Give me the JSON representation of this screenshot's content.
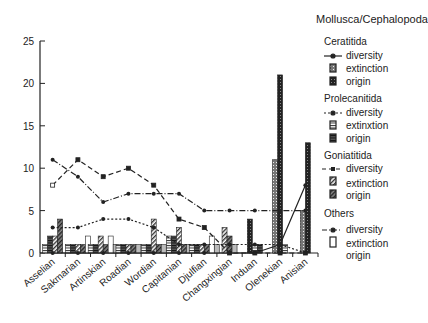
{
  "chart_data": {
    "type": "bar",
    "title": "Mollusca/Cephalopoda",
    "xlabel": "",
    "ylabel": "",
    "ylim": [
      0,
      25
    ],
    "yticks": [
      0,
      5,
      10,
      15,
      20,
      25
    ],
    "grid": false,
    "legend_position": "right",
    "categories": [
      "Asselian",
      "Sakmarian",
      "Artinskian",
      "Roadian",
      "Wordian",
      "Capitanian",
      "Djulfian",
      "Changxingian",
      "Induan",
      "Olenekian",
      "Anisian"
    ],
    "series": [
      {
        "group": "Ceratitida",
        "name": "diversity",
        "kind": "line",
        "style": "solid",
        "values": [
          0,
          0,
          0,
          0,
          0,
          0,
          0,
          0,
          0,
          1,
          8
        ]
      },
      {
        "group": "Ceratitida",
        "name": "extinction",
        "kind": "bar",
        "values": [
          0,
          0,
          0,
          0,
          0,
          0,
          0,
          0,
          0,
          11,
          5
        ]
      },
      {
        "group": "Ceratitida",
        "name": "origin",
        "kind": "bar",
        "values": [
          0,
          0,
          0,
          0,
          0,
          0,
          0,
          0,
          4,
          21,
          13
        ]
      },
      {
        "group": "Prolecanitida",
        "name": "diversity",
        "kind": "line",
        "style": "dashed",
        "values": [
          3,
          3,
          4,
          4,
          3,
          1,
          1,
          1,
          1,
          1,
          0
        ]
      },
      {
        "group": "Prolecanitida",
        "name": "extinction",
        "kind": "bar",
        "values": [
          1,
          1,
          1,
          1,
          1,
          2,
          1,
          0,
          1,
          1,
          0
        ]
      },
      {
        "group": "Prolecanitida",
        "name": "origin",
        "kind": "bar",
        "values": [
          2,
          1,
          1,
          1,
          1,
          2,
          1,
          0,
          1,
          0,
          0
        ]
      },
      {
        "group": "Goniatitida",
        "name": "diversity",
        "kind": "line",
        "style": "longdash",
        "values": [
          8,
          11,
          9,
          10,
          8,
          4,
          3,
          0,
          0,
          0,
          0
        ]
      },
      {
        "group": "Goniatitida",
        "name": "extinction",
        "kind": "bar",
        "values": [
          2,
          1,
          2,
          1,
          4,
          3,
          1,
          3,
          0,
          0,
          0
        ]
      },
      {
        "group": "Goniatitida",
        "name": "origin",
        "kind": "bar",
        "values": [
          4,
          1,
          1,
          1,
          1,
          1,
          1,
          2,
          0,
          0,
          0
        ]
      },
      {
        "group": "Others",
        "name": "diversity",
        "kind": "line",
        "style": "dashdot",
        "values": [
          11,
          9,
          6,
          7,
          7,
          7,
          5,
          5,
          5,
          5,
          5
        ]
      },
      {
        "group": "Others",
        "name": "extinction",
        "kind": "bar",
        "values": [
          0,
          2,
          2,
          0,
          0,
          0,
          2,
          0,
          0,
          0,
          0
        ]
      },
      {
        "group": "Others",
        "name": "origin",
        "kind": "bar",
        "values": [
          0,
          0,
          1,
          1,
          1,
          1,
          1,
          1,
          0,
          0,
          0
        ]
      }
    ]
  },
  "legend": {
    "title": "Mollusca/Cephalopoda",
    "groups": [
      {
        "name": "Ceratitida",
        "items": [
          "diversity",
          "extinction",
          "origin"
        ]
      },
      {
        "name": "Prolecanitida",
        "items": [
          "diversity",
          "extinxtion",
          "origin"
        ]
      },
      {
        "name": "Goniatitida",
        "items": [
          "diversity",
          "extinction",
          "origin"
        ]
      },
      {
        "name": "Others",
        "items": [
          "diversity",
          "extinction",
          "origin"
        ]
      }
    ]
  }
}
